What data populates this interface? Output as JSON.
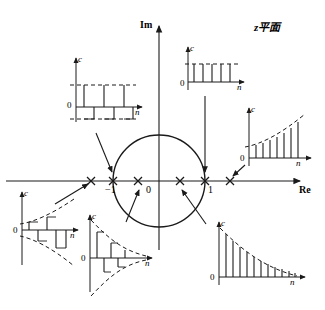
{
  "figure": {
    "plane_label": "z平面",
    "domain_type": "z-plane pole-location vs time-sequence map"
  },
  "axes": {
    "imaginary_label": "Im",
    "real_label": "Re",
    "origin_label": "0",
    "tick_neg_one": "−1",
    "tick_pos_one": "1"
  },
  "unit_circle": {
    "radius_value": 1,
    "center_x": 0,
    "center_y": 0
  },
  "pole_markers": [
    {
      "id": "pole-outside-left",
      "glyph": "x",
      "re": -1.9,
      "im": 0,
      "region": "outside-unit-circle-negative-real"
    },
    {
      "id": "pole-on-circle-left",
      "glyph": "x",
      "re": -1.0,
      "im": 0,
      "region": "on-unit-circle-negative-real"
    },
    {
      "id": "pole-inside-left",
      "glyph": "x",
      "re": -0.45,
      "im": 0,
      "region": "inside-unit-circle-negative-real"
    },
    {
      "id": "pole-inside-right",
      "glyph": "x",
      "re": 0.55,
      "im": 0,
      "region": "inside-unit-circle-positive-real"
    },
    {
      "id": "pole-on-circle-right",
      "glyph": "x",
      "re": 1.0,
      "im": 0,
      "region": "on-unit-circle-positive-real"
    },
    {
      "id": "pole-outside-right",
      "glyph": "x",
      "re": 1.55,
      "im": 0,
      "region": "outside-unit-circle-positive-real"
    }
  ],
  "insets": {
    "top_left": {
      "name": "alternating-constant-sequence",
      "c_label": "c",
      "n_label": "n",
      "zero_label": "0",
      "pole_ref": "pole-on-circle-left",
      "envelope": "constant",
      "sign": "alternating",
      "samples": [
        1,
        -1,
        1,
        -1,
        1,
        -1
      ]
    },
    "top_center": {
      "name": "constant-sequence",
      "c_label": "c",
      "n_label": "n",
      "zero_label": "0",
      "pole_ref": "pole-on-circle-right",
      "envelope": "constant",
      "sign": "positive",
      "samples": [
        1,
        1,
        1,
        1,
        1
      ]
    },
    "right": {
      "name": "growing-exponential-sequence",
      "c_label": "c",
      "n_label": "n",
      "zero_label": "0",
      "pole_ref": "pole-outside-right",
      "envelope": "growing",
      "sign": "positive",
      "samples": [
        0.3,
        0.35,
        0.42,
        0.5,
        0.6,
        0.72,
        0.86,
        1.0
      ]
    },
    "bottom_right": {
      "name": "decaying-exponential-sequence",
      "c_label": "c",
      "n_label": "n",
      "zero_label": "0",
      "pole_ref": "pole-inside-right",
      "envelope": "decaying",
      "sign": "positive",
      "samples": [
        1.0,
        0.76,
        0.58,
        0.44,
        0.33,
        0.25,
        0.19,
        0.145,
        0.11,
        0.08,
        0.06,
        0.045
      ]
    },
    "bottom_left": {
      "name": "alternating-growing-exponential-sequence",
      "c_label": "c",
      "n_label": "n",
      "zero_label": "0",
      "pole_ref": "pole-outside-left",
      "envelope": "growing",
      "sign": "alternating",
      "samples": [
        0.3,
        -0.36,
        0.46,
        -0.58,
        0.75,
        -0.95
      ]
    },
    "bottom_center": {
      "name": "alternating-decaying-exponential-sequence",
      "c_label": "c",
      "n_label": "n",
      "zero_label": "0",
      "pole_ref": "pole-inside-left",
      "envelope": "decaying",
      "sign": "alternating",
      "samples": [
        1.0,
        -0.7,
        0.48,
        -0.33,
        0.22,
        -0.15,
        0.1,
        -0.07
      ]
    }
  },
  "colors": {
    "stroke": "#1a1a1a",
    "background": "#ffffff"
  }
}
